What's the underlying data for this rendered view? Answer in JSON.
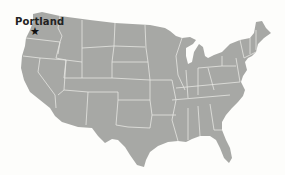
{
  "map": {
    "title": "United States",
    "fill_color": "#a7a8a5",
    "border_color": "#e6e6e2",
    "background_color": "#fdfdfb",
    "marker": {
      "label": "Portland",
      "icon": "star-icon",
      "glyph": "★"
    }
  }
}
